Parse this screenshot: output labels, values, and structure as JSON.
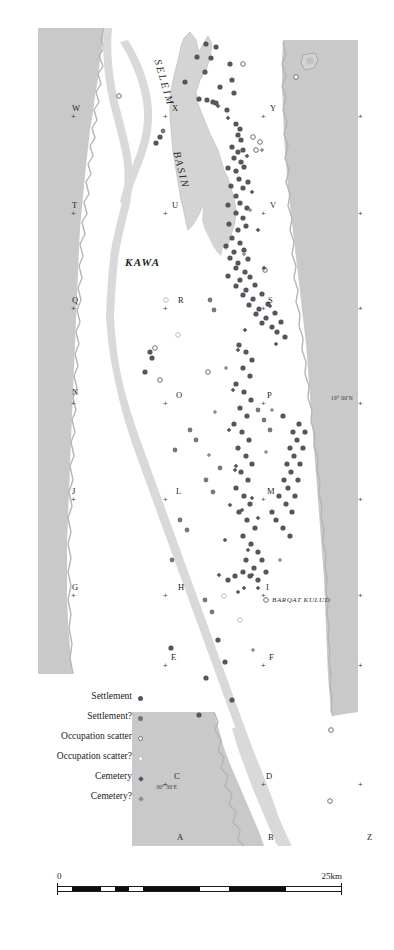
{
  "figure": {
    "type": "archaeological-survey-map",
    "region": "Kawa and the Seleim Basin, Northern Dongola Reach"
  },
  "labels": {
    "basin_name": "SELEIM BASIN",
    "basin_word_1": "SELEIM",
    "basin_word_2": "BASIN",
    "kawa": "KAWA",
    "barqat_kulud": "BARQAT KULUD",
    "coord_lat": "19° 00'N",
    "coord_lon": "30° 30'E"
  },
  "legend": {
    "items": [
      {
        "label": "Settlement",
        "symbol": "filled-dot",
        "color": "#53565c"
      },
      {
        "label": "Settlement?",
        "symbol": "filled-dot-light",
        "color": "#6f7379"
      },
      {
        "label": "Occupation scatter",
        "symbol": "open-circle",
        "color": "#6b6e74"
      },
      {
        "label": "Occupation scatter?",
        "symbol": "open-circle-light",
        "color": "#b6b8bb"
      },
      {
        "label": "Cemetery",
        "symbol": "filled-diamond",
        "color": "#53565c"
      },
      {
        "label": "Cemetery?",
        "symbol": "filled-diamond-light",
        "color": "#8d9097"
      }
    ]
  },
  "scale": {
    "min_label": "0",
    "max_label": "25km",
    "units": "km",
    "length_km": 25
  },
  "grid": {
    "letters": [
      {
        "id": "W",
        "x": 72,
        "y": 104
      },
      {
        "id": "X",
        "x": 172,
        "y": 104
      },
      {
        "id": "Y",
        "x": 270,
        "y": 104
      },
      {
        "id": "T",
        "x": 72,
        "y": 201
      },
      {
        "id": "U",
        "x": 172,
        "y": 201
      },
      {
        "id": "V",
        "x": 270,
        "y": 201
      },
      {
        "id": "Q",
        "x": 72,
        "y": 296
      },
      {
        "id": "R",
        "x": 178,
        "y": 296
      },
      {
        "id": "S",
        "x": 268,
        "y": 296
      },
      {
        "id": "N",
        "x": 72,
        "y": 388
      },
      {
        "id": "O",
        "x": 176,
        "y": 391
      },
      {
        "id": "P",
        "x": 267,
        "y": 391
      },
      {
        "id": "J",
        "x": 72,
        "y": 487
      },
      {
        "id": "L",
        "x": 176,
        "y": 487
      },
      {
        "id": "M",
        "x": 267,
        "y": 487
      },
      {
        "id": "G",
        "x": 72,
        "y": 583
      },
      {
        "id": "H",
        "x": 178,
        "y": 583
      },
      {
        "id": "I",
        "x": 266,
        "y": 583
      },
      {
        "id": "E",
        "x": 171,
        "y": 653
      },
      {
        "id": "F",
        "x": 269,
        "y": 653
      },
      {
        "id": "C",
        "x": 174,
        "y": 772
      },
      {
        "id": "D",
        "x": 266,
        "y": 772
      },
      {
        "id": "A",
        "x": 177,
        "y": 833
      },
      {
        "id": "B",
        "x": 268,
        "y": 833
      },
      {
        "id": "Z",
        "x": 367,
        "y": 833
      }
    ],
    "ticks": [
      {
        "x": 71,
        "y": 113
      },
      {
        "x": 163,
        "y": 113
      },
      {
        "x": 261,
        "y": 113
      },
      {
        "x": 358,
        "y": 113
      },
      {
        "x": 71,
        "y": 210
      },
      {
        "x": 163,
        "y": 210
      },
      {
        "x": 261,
        "y": 210
      },
      {
        "x": 358,
        "y": 210
      },
      {
        "x": 71,
        "y": 305
      },
      {
        "x": 163,
        "y": 305
      },
      {
        "x": 261,
        "y": 305
      },
      {
        "x": 358,
        "y": 305
      },
      {
        "x": 71,
        "y": 400
      },
      {
        "x": 163,
        "y": 400
      },
      {
        "x": 261,
        "y": 400
      },
      {
        "x": 358,
        "y": 400
      },
      {
        "x": 71,
        "y": 496
      },
      {
        "x": 163,
        "y": 496
      },
      {
        "x": 261,
        "y": 496
      },
      {
        "x": 358,
        "y": 496
      },
      {
        "x": 71,
        "y": 592
      },
      {
        "x": 163,
        "y": 592
      },
      {
        "x": 261,
        "y": 592
      },
      {
        "x": 358,
        "y": 592
      },
      {
        "x": 163,
        "y": 662
      },
      {
        "x": 261,
        "y": 662
      },
      {
        "x": 358,
        "y": 662
      },
      {
        "x": 163,
        "y": 781
      },
      {
        "x": 261,
        "y": 781
      },
      {
        "x": 358,
        "y": 781
      }
    ]
  },
  "colors": {
    "desert_fill": "#c9c9c9",
    "basin_fill": "#d4d4d4",
    "river_fill": "#d9d9d9",
    "site_dark": "#53565c",
    "site_light": "#8d9097",
    "background": "#ffffff"
  },
  "sites": {
    "settlement": [
      [
        206,
        44
      ],
      [
        216,
        47
      ],
      [
        197,
        57
      ],
      [
        211,
        58
      ],
      [
        230,
        64
      ],
      [
        205,
        72
      ],
      [
        185,
        82
      ],
      [
        232,
        80
      ],
      [
        220,
        87
      ],
      [
        234,
        93
      ],
      [
        199,
        99
      ],
      [
        207,
        100
      ],
      [
        213,
        102
      ],
      [
        216,
        103
      ],
      [
        227,
        110
      ],
      [
        160,
        137
      ],
      [
        156,
        143
      ],
      [
        236,
        124
      ],
      [
        240,
        129
      ],
      [
        238,
        135
      ],
      [
        241,
        140
      ],
      [
        232,
        147
      ],
      [
        238,
        152
      ],
      [
        243,
        150
      ],
      [
        234,
        158
      ],
      [
        241,
        162
      ],
      [
        228,
        168
      ],
      [
        236,
        171
      ],
      [
        244,
        167
      ],
      [
        239,
        179
      ],
      [
        231,
        186
      ],
      [
        243,
        188
      ],
      [
        248,
        182
      ],
      [
        236,
        196
      ],
      [
        228,
        205
      ],
      [
        240,
        203
      ],
      [
        247,
        208
      ],
      [
        236,
        213
      ],
      [
        243,
        218
      ],
      [
        229,
        224
      ],
      [
        238,
        230
      ],
      [
        246,
        226
      ],
      [
        232,
        238
      ],
      [
        240,
        243
      ],
      [
        226,
        246
      ],
      [
        234,
        252
      ],
      [
        244,
        250
      ],
      [
        230,
        258
      ],
      [
        238,
        263
      ],
      [
        248,
        259
      ],
      [
        236,
        268
      ],
      [
        245,
        272
      ],
      [
        228,
        276
      ],
      [
        240,
        280
      ],
      [
        250,
        277
      ],
      [
        236,
        286
      ],
      [
        246,
        290
      ],
      [
        255,
        285
      ],
      [
        243,
        295
      ],
      [
        253,
        299
      ],
      [
        262,
        294
      ],
      [
        249,
        305
      ],
      [
        259,
        309
      ],
      [
        268,
        304
      ],
      [
        256,
        314
      ],
      [
        266,
        318
      ],
      [
        275,
        313
      ],
      [
        262,
        323
      ],
      [
        272,
        327
      ],
      [
        281,
        322
      ],
      [
        277,
        332
      ],
      [
        285,
        337
      ],
      [
        150,
        352
      ],
      [
        152,
        358
      ],
      [
        145,
        372
      ],
      [
        239,
        345
      ],
      [
        246,
        352
      ],
      [
        252,
        360
      ],
      [
        243,
        368
      ],
      [
        250,
        376
      ],
      [
        236,
        384
      ],
      [
        244,
        392
      ],
      [
        251,
        400
      ],
      [
        240,
        408
      ],
      [
        247,
        416
      ],
      [
        234,
        424
      ],
      [
        242,
        432
      ],
      [
        249,
        440
      ],
      [
        238,
        448
      ],
      [
        246,
        456
      ],
      [
        252,
        464
      ],
      [
        241,
        472
      ],
      [
        248,
        480
      ],
      [
        236,
        488
      ],
      [
        244,
        496
      ],
      [
        250,
        504
      ],
      [
        239,
        512
      ],
      [
        247,
        520
      ],
      [
        255,
        528
      ],
      [
        243,
        536
      ],
      [
        251,
        544
      ],
      [
        258,
        552
      ],
      [
        246,
        560
      ],
      [
        254,
        568
      ],
      [
        262,
        560
      ],
      [
        250,
        576
      ],
      [
        258,
        580
      ],
      [
        266,
        572
      ],
      [
        243,
        572
      ],
      [
        235,
        576
      ],
      [
        228,
        580
      ],
      [
        276,
        520
      ],
      [
        283,
        528
      ],
      [
        290,
        536
      ],
      [
        272,
        512
      ],
      [
        286,
        504
      ],
      [
        292,
        512
      ],
      [
        279,
        496
      ],
      [
        288,
        488
      ],
      [
        295,
        496
      ],
      [
        284,
        480
      ],
      [
        291,
        472
      ],
      [
        298,
        480
      ],
      [
        287,
        464
      ],
      [
        294,
        456
      ],
      [
        300,
        464
      ],
      [
        290,
        448
      ],
      [
        297,
        440
      ],
      [
        303,
        448
      ],
      [
        293,
        432
      ],
      [
        299,
        424
      ],
      [
        305,
        432
      ],
      [
        283,
        416
      ],
      [
        171,
        648
      ],
      [
        206,
        678
      ],
      [
        199,
        715
      ],
      [
        218,
        640
      ],
      [
        225,
        662
      ],
      [
        232,
        700
      ]
    ],
    "settlement_q": [
      [
        163,
        131
      ],
      [
        210,
        300
      ],
      [
        214,
        310
      ],
      [
        190,
        430
      ],
      [
        196,
        440
      ],
      [
        175,
        450
      ],
      [
        180,
        520
      ],
      [
        187,
        530
      ],
      [
        172,
        560
      ],
      [
        205,
        600
      ],
      [
        212,
        612
      ],
      [
        258,
        410
      ],
      [
        264,
        420
      ],
      [
        270,
        430
      ],
      [
        206,
        480
      ],
      [
        213,
        492
      ],
      [
        220,
        468
      ]
    ],
    "occupation_scatter": [
      [
        243,
        64
      ],
      [
        296,
        77
      ],
      [
        119,
        96
      ],
      [
        253,
        137
      ],
      [
        260,
        142
      ],
      [
        256,
        150
      ],
      [
        265,
        270
      ],
      [
        155,
        348
      ],
      [
        160,
        380
      ],
      [
        208,
        372
      ],
      [
        331,
        730
      ],
      [
        330,
        801
      ],
      [
        266,
        600
      ]
    ],
    "occupation_scatter_q": [
      [
        166,
        300
      ],
      [
        178,
        335
      ],
      [
        224,
        596
      ],
      [
        240,
        620
      ]
    ],
    "cemetery": [
      [
        218,
        106
      ],
      [
        228,
        118
      ],
      [
        247,
        156
      ],
      [
        252,
        192
      ],
      [
        258,
        230
      ],
      [
        264,
        268
      ],
      [
        270,
        306
      ],
      [
        276,
        344
      ],
      [
        245,
        330
      ],
      [
        238,
        350
      ],
      [
        233,
        390
      ],
      [
        229,
        430
      ],
      [
        235,
        470
      ],
      [
        242,
        510
      ],
      [
        248,
        550
      ],
      [
        252,
        575
      ],
      [
        258,
        588
      ],
      [
        244,
        588
      ],
      [
        238,
        592
      ],
      [
        252,
        498
      ],
      [
        258,
        518
      ],
      [
        236,
        466
      ],
      [
        230,
        505
      ],
      [
        225,
        540
      ],
      [
        219,
        575
      ]
    ],
    "cemetery_q": [
      [
        262,
        150
      ],
      [
        250,
        210
      ],
      [
        244,
        254
      ],
      [
        272,
        410
      ],
      [
        266,
        452
      ],
      [
        280,
        560
      ],
      [
        226,
        368
      ],
      [
        215,
        412
      ],
      [
        209,
        455
      ],
      [
        253,
        650
      ]
    ]
  }
}
